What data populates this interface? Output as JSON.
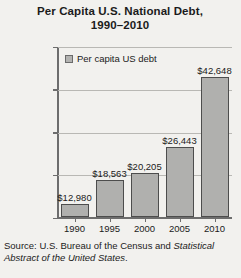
{
  "chart_data": {
    "type": "bar",
    "title": "Per Capita U.S. National Debt, 1990–2010",
    "title_line1": "Per Capita U.S. National Debt,",
    "title_line2": "1990–2010",
    "categories": [
      "1990",
      "1995",
      "2000",
      "2005",
      "2010"
    ],
    "values": [
      12980,
      18563,
      20205,
      26443,
      42648
    ],
    "value_labels": [
      "$12,980",
      "$18,563",
      "$20,205",
      "$26,443",
      "$42,648"
    ],
    "series": [
      {
        "name": "Per capita US debt",
        "values": [
          12980,
          18563,
          20205,
          26443,
          42648
        ]
      }
    ],
    "xlabel": "",
    "ylabel": "",
    "ylim": [
      10000,
      50000
    ],
    "ytick_values": [
      10000,
      20000,
      30000,
      40000,
      50000
    ],
    "ytick_labels": [
      "$10,000",
      "$20,000",
      "$30,000",
      "$40,000",
      "$50,000"
    ],
    "grid": true,
    "legend_position": "inside-top-left",
    "legend_entries": [
      "Per capita US debt"
    ],
    "bar_color": "#b0b0ae",
    "bar_border_color": "#4d4d4d",
    "axis_color": "#6d6d6d",
    "gridline_color": "#b9b8b4",
    "background_color": "#f2f1ee"
  },
  "legend": {
    "label": "Per capita US debt"
  },
  "source": {
    "prefix": "Source: U.S. Bureau of the Census and ",
    "italic": "Statistical Abstract of the United States",
    "suffix": "."
  }
}
